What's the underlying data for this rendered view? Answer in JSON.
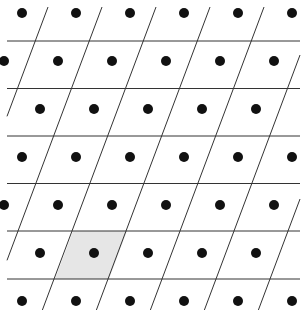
{
  "diagram": {
    "title": "",
    "type": "2d-lattice-unit-cells",
    "width": 304,
    "height": 316,
    "lattice": {
      "origin": [
        22,
        13
      ],
      "vector_a": [
        54,
        0
      ],
      "vector_b": [
        -18,
        48
      ],
      "dot_rows": 7,
      "dot_radius": 5,
      "dot_color": "#111111"
    },
    "grid": {
      "line_color": "#333333",
      "line_width": 1,
      "horizontal_lines_y": [
        41,
        88.5,
        136,
        183.5,
        231,
        279
      ],
      "horizontal_x_range": [
        7,
        300
      ],
      "slanted_line_top_x": [
        48,
        102,
        156,
        210,
        264,
        318,
        372,
        426
      ],
      "slanted_y_range": [
        7,
        310
      ],
      "slope_dx_per_dy": -0.375
    },
    "highlighted_cell": {
      "label": "unit cell",
      "fill": "#e6e6e6",
      "polygon": [
        [
          73,
          231
        ],
        [
          127,
          231
        ],
        [
          109,
          279
        ],
        [
          55,
          279
        ]
      ],
      "center_dot": [
        93,
        254
      ]
    },
    "clip": {
      "x": 7,
      "y": 7,
      "width": 293,
      "height": 303
    }
  }
}
